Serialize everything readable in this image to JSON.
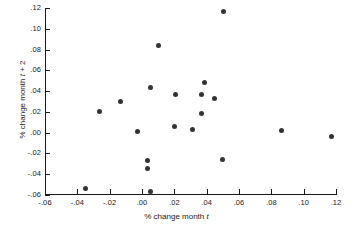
{
  "chart_data": {
    "type": "scatter",
    "title": "",
    "xlabel": "% change month t",
    "ylabel": "% change month t + 2",
    "xlim": [
      -0.06,
      0.12
    ],
    "ylim": [
      -0.06,
      0.12
    ],
    "grid": false,
    "legend": "none",
    "xticks": [
      -0.06,
      -0.04,
      -0.02,
      0.0,
      0.02,
      0.04,
      0.06,
      0.08,
      0.1,
      0.12
    ],
    "xticklabels": [
      "-.06",
      "-.04",
      "-.02",
      ".00",
      ".02",
      ".04",
      ".06",
      ".08",
      ".10",
      ".12"
    ],
    "yticks": [
      -0.06,
      -0.04,
      -0.02,
      0.0,
      0.02,
      0.04,
      0.06,
      0.08,
      0.1,
      0.12
    ],
    "yticklabels": [
      "-.06",
      "-.04",
      "-.02",
      ".00",
      ".02",
      ".04",
      ".06",
      ".08",
      ".10",
      ".12"
    ],
    "points": [
      {
        "x": -0.0351,
        "y": -0.0534
      },
      {
        "x": -0.0265,
        "y": 0.0199
      },
      {
        "x": -0.0131,
        "y": 0.03
      },
      {
        "x": -0.0026,
        "y": 0.0008
      },
      {
        "x": 0.0036,
        "y": -0.0268
      },
      {
        "x": 0.0036,
        "y": -0.0342
      },
      {
        "x": 0.005,
        "y": -0.0568
      },
      {
        "x": 0.0052,
        "y": 0.0438
      },
      {
        "x": 0.0099,
        "y": 0.084
      },
      {
        "x": 0.0207,
        "y": 0.0366
      },
      {
        "x": 0.0199,
        "y": 0.0064
      },
      {
        "x": 0.0311,
        "y": 0.0035
      },
      {
        "x": 0.0366,
        "y": 0.0366
      },
      {
        "x": 0.0367,
        "y": 0.018
      },
      {
        "x": 0.0385,
        "y": 0.0482
      },
      {
        "x": 0.0447,
        "y": 0.0329
      },
      {
        "x": 0.0503,
        "y": 0.1162
      },
      {
        "x": 0.0499,
        "y": -0.0256
      },
      {
        "x": 0.0863,
        "y": 0.0019
      },
      {
        "x": 0.1175,
        "y": -0.0037
      }
    ],
    "marker_color": "#333333",
    "axis_color": "#1a1a1a",
    "background_color": "#ffffff"
  }
}
